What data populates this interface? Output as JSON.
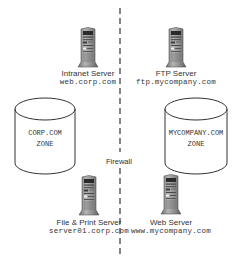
{
  "diagram": {
    "firewall_label": "Firewall",
    "zones": [
      {
        "line1": "CORP.COM",
        "line2": "ZONE"
      },
      {
        "line1": "MYCOMPANY.COM",
        "line2": "ZONE"
      }
    ],
    "servers": [
      {
        "name": "Intranet Server",
        "host": "web.corp.com",
        "zone": "CORP.COM"
      },
      {
        "name": "FTP Server",
        "host": "ftp.mycompany.com",
        "zone": "MYCOMPANY.COM"
      },
      {
        "name": "File & Print Server",
        "host": "server01.corp.com",
        "zone": "CORP.COM"
      },
      {
        "name": "Web Server",
        "host": "www.mycompany.com",
        "zone": "MYCOMPANY.COM"
      }
    ],
    "colors": {
      "line": "#444444",
      "server_body": "#8a8a8a",
      "server_dark": "#3a3a3a",
      "text": "#333333"
    }
  }
}
